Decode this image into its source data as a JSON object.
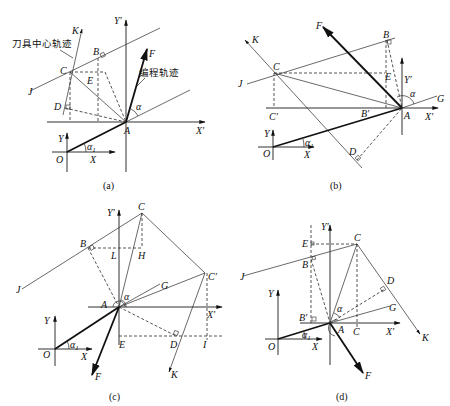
{
  "figures": [
    {
      "id": "a",
      "caption": "(a)",
      "labels": {
        "K": "K",
        "C": "C",
        "B": "B",
        "E": "E",
        "D": "D",
        "J": "J",
        "F": "F",
        "A": "A",
        "Xp": "X′",
        "Yp": "Y′",
        "X": "X",
        "Y": "Y",
        "O": "O",
        "alpha": "α",
        "alpha1": "α",
        "alpha1_sub": "1"
      },
      "annotations": {
        "tool_path": "刀具中心轨迹",
        "program_path": "编程轨迹"
      }
    },
    {
      "id": "b",
      "caption": "(b)",
      "labels": {
        "F": "F",
        "K": "K",
        "B": "B",
        "C": "C",
        "E": "E",
        "J": "J",
        "Yp": "Y′",
        "alpha": "α",
        "G": "G",
        "Cp": "C′",
        "Bp": "B′",
        "A": "A",
        "Xp": "X′",
        "Y": "Y",
        "O": "O",
        "X": "X",
        "alpha1": "α",
        "alpha1_sub": "1",
        "D": "D"
      }
    },
    {
      "id": "c",
      "caption": "(c)",
      "labels": {
        "C": "C",
        "Yp": "Y′",
        "B": "B",
        "L": "L",
        "H": "H",
        "Cp": "C′",
        "G": "G",
        "J": "J",
        "alpha": "α",
        "A": "A",
        "Xp": "X′",
        "Y": "Y",
        "E": "E",
        "D": "D",
        "I": "I",
        "O": "O",
        "X": "X",
        "alpha1": "α",
        "alpha1_sub": "1",
        "F": "F",
        "K": "K"
      }
    },
    {
      "id": "d",
      "caption": "(d)",
      "labels": {
        "Yp": "Y′",
        "E": "E",
        "C": "C",
        "B": "B",
        "J": "J",
        "D": "D",
        "Y": "Y",
        "alpha": "α",
        "G": "G",
        "Bp": "B′",
        "A": "A",
        "C2": "C",
        "Xp": "X′",
        "K": "K",
        "O": "O",
        "X": "X",
        "alpha1": "α",
        "alpha1_sub": "1",
        "F": "F"
      }
    }
  ]
}
